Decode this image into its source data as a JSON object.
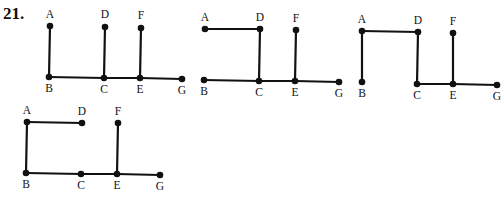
{
  "problem_number": "21.",
  "colors": {
    "ink": "#111111",
    "background": "#ffffff"
  },
  "graphs": [
    {
      "id": "graph-1",
      "description": "Star-like tree: A-B, D-C, F-E vertical; B-C-E-G horizontal",
      "nodes": [
        {
          "id": "A",
          "label": "A",
          "x": 50,
          "y": 26,
          "lx": 50,
          "ly": 18
        },
        {
          "id": "B",
          "label": "B",
          "x": 49,
          "y": 77,
          "lx": 49,
          "ly": 92
        },
        {
          "id": "D",
          "label": "D",
          "x": 105,
          "y": 27,
          "lx": 105,
          "ly": 18
        },
        {
          "id": "C",
          "label": "C",
          "x": 104,
          "y": 78,
          "lx": 104,
          "ly": 93
        },
        {
          "id": "F",
          "label": "F",
          "x": 141,
          "y": 28,
          "lx": 141,
          "ly": 19
        },
        {
          "id": "E",
          "label": "E",
          "x": 140,
          "y": 78,
          "lx": 140,
          "ly": 93
        },
        {
          "id": "G",
          "label": "G",
          "x": 182,
          "y": 79,
          "lx": 182,
          "ly": 94
        }
      ],
      "edges": [
        [
          "A",
          "B"
        ],
        [
          "D",
          "C"
        ],
        [
          "F",
          "E"
        ],
        [
          "B",
          "C"
        ],
        [
          "C",
          "E"
        ],
        [
          "E",
          "G"
        ]
      ]
    },
    {
      "id": "graph-2",
      "description": "Tree: A-D horizontal, D-C vertical, F-E vertical; B-C-E-G horizontal",
      "nodes": [
        {
          "id": "A",
          "label": "A",
          "x": 205,
          "y": 29,
          "lx": 205,
          "ly": 21
        },
        {
          "id": "D",
          "label": "D",
          "x": 260,
          "y": 29,
          "lx": 260,
          "ly": 21
        },
        {
          "id": "F",
          "label": "F",
          "x": 296,
          "y": 30,
          "lx": 296,
          "ly": 22
        },
        {
          "id": "B",
          "label": "B",
          "x": 204,
          "y": 80,
          "lx": 204,
          "ly": 95
        },
        {
          "id": "C",
          "label": "C",
          "x": 259,
          "y": 81,
          "lx": 259,
          "ly": 96
        },
        {
          "id": "E",
          "label": "E",
          "x": 295,
          "y": 81,
          "lx": 295,
          "ly": 96
        },
        {
          "id": "G",
          "label": "G",
          "x": 339,
          "y": 82,
          "lx": 339,
          "ly": 97
        }
      ],
      "edges": [
        [
          "A",
          "D"
        ],
        [
          "D",
          "C"
        ],
        [
          "F",
          "E"
        ],
        [
          "B",
          "C"
        ],
        [
          "C",
          "E"
        ],
        [
          "E",
          "G"
        ]
      ]
    },
    {
      "id": "graph-3",
      "description": "Path-like tree: B-A vertical, A-D horizontal, D-C vertical, F-E vertical; C-E-G horizontal",
      "nodes": [
        {
          "id": "A",
          "label": "A",
          "x": 362,
          "y": 31,
          "lx": 362,
          "ly": 23
        },
        {
          "id": "D",
          "label": "D",
          "x": 418,
          "y": 32,
          "lx": 418,
          "ly": 24
        },
        {
          "id": "F",
          "label": "F",
          "x": 453,
          "y": 33,
          "lx": 453,
          "ly": 25
        },
        {
          "id": "B",
          "label": "B",
          "x": 362,
          "y": 82,
          "lx": 362,
          "ly": 97
        },
        {
          "id": "C",
          "label": "C",
          "x": 417,
          "y": 84,
          "lx": 417,
          "ly": 99
        },
        {
          "id": "E",
          "label": "E",
          "x": 453,
          "y": 84,
          "lx": 453,
          "ly": 99
        },
        {
          "id": "G",
          "label": "G",
          "x": 497,
          "y": 85,
          "lx": 497,
          "ly": 100
        }
      ],
      "edges": [
        [
          "B",
          "A"
        ],
        [
          "A",
          "D"
        ],
        [
          "D",
          "C"
        ],
        [
          "F",
          "E"
        ],
        [
          "C",
          "E"
        ],
        [
          "E",
          "G"
        ]
      ]
    },
    {
      "id": "graph-4",
      "description": "Tree: D-A horizontal, A-B vertical, F-E vertical; B-C-E-G horizontal",
      "nodes": [
        {
          "id": "A",
          "label": "A",
          "x": 27,
          "y": 122,
          "lx": 27,
          "ly": 114
        },
        {
          "id": "D",
          "label": "D",
          "x": 82,
          "y": 123,
          "lx": 82,
          "ly": 115
        },
        {
          "id": "F",
          "label": "F",
          "x": 118,
          "y": 123,
          "lx": 118,
          "ly": 115
        },
        {
          "id": "B",
          "label": "B",
          "x": 26,
          "y": 173,
          "lx": 26,
          "ly": 188
        },
        {
          "id": "C",
          "label": "C",
          "x": 81,
          "y": 174,
          "lx": 81,
          "ly": 189
        },
        {
          "id": "E",
          "label": "E",
          "x": 117,
          "y": 174,
          "lx": 117,
          "ly": 189
        },
        {
          "id": "G",
          "label": "G",
          "x": 160,
          "y": 175,
          "lx": 160,
          "ly": 190
        }
      ],
      "edges": [
        [
          "D",
          "A"
        ],
        [
          "A",
          "B"
        ],
        [
          "F",
          "E"
        ],
        [
          "B",
          "C"
        ],
        [
          "C",
          "E"
        ],
        [
          "E",
          "G"
        ]
      ]
    }
  ]
}
